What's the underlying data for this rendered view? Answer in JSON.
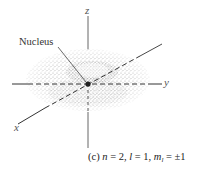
{
  "figure": {
    "type": "atomic-orbital-probability-density",
    "shape": "torus (doughnut) in xy-plane",
    "axes": {
      "x_label": "x",
      "y_label": "y",
      "z_label": "z"
    },
    "annotation": {
      "label": "Nucleus"
    },
    "caption": {
      "panel": "(c)",
      "n_symbol": "n",
      "n_value": "2",
      "l_symbol": "l",
      "l_value": "1",
      "ml_symbol": "m",
      "ml_sub": "l",
      "ml_value": "±1",
      "full_text": "(c) n = 2, l = 1, m_l = ±1"
    },
    "colors": {
      "cloud": "#9a9a9a",
      "axis": "#333333",
      "nucleus": "#222222"
    }
  }
}
